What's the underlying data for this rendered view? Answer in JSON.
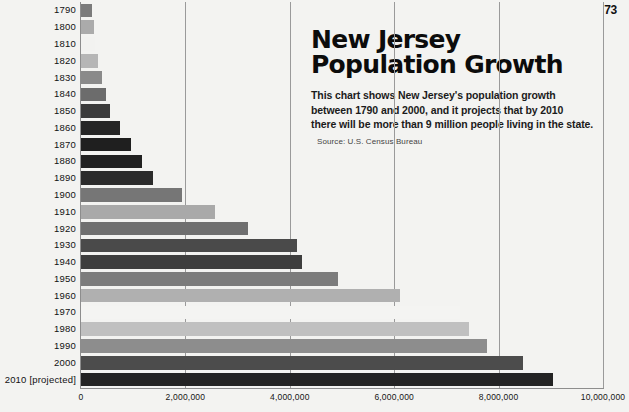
{
  "page": {
    "number": "73"
  },
  "headline": {
    "line1": "New Jersey",
    "line2": "Population Growth"
  },
  "deck": {
    "line1": "This chart shows New Jersey's population growth",
    "line2": "between 1790 and 2000, and it projects that by 2010",
    "line3": "there will be more than 9 million people living in the state.",
    "source": "Source: U.S. Census Bureau"
  },
  "chart_data": {
    "type": "bar",
    "orientation": "horizontal",
    "title": "New Jersey Population Growth",
    "xlabel": "",
    "ylabel": "",
    "xlim": [
      0,
      10000000
    ],
    "grid": true,
    "legend": false,
    "xticks": [
      "0",
      "2,000,000",
      "4,000,000",
      "6,000,000",
      "8,000,000",
      "10,000,000"
    ],
    "xtick_values": [
      0,
      2000000,
      4000000,
      6000000,
      8000000,
      10000000
    ],
    "categories": [
      "1790",
      "1800",
      "1810",
      "1820",
      "1830",
      "1840",
      "1850",
      "1860",
      "1870",
      "1880",
      "1890",
      "1900",
      "1910",
      "1920",
      "1930",
      "1940",
      "1950",
      "1960",
      "1970",
      "1980",
      "1990",
      "2000",
      "2010 [projected]"
    ],
    "values": [
      210000,
      250000,
      270000,
      330000,
      400000,
      480000,
      550000,
      740000,
      960000,
      1170000,
      1380000,
      1930000,
      2570000,
      3200000,
      4130000,
      4230000,
      4920000,
      6110000,
      7260000,
      7430000,
      7780000,
      8470000,
      9040000
    ],
    "bar_colors": [
      "#7b7b7b",
      "#ababab",
      "#f2f2f0",
      "#b6b6b6",
      "#8a8a8a",
      "#6c6c6c",
      "#3b3b3b",
      "#262626",
      "#1f1f1f",
      "#212121",
      "#2b2b2b",
      "#767676",
      "#a9a9a9",
      "#6f6f6f",
      "#4a4a4a",
      "#3e3e3e",
      "#7c7c7c",
      "#b0b0b0",
      "#f4f4f2",
      "#c0c0c0",
      "#8d8d8d",
      "#4c4c4c",
      "#232323"
    ]
  },
  "colors": {
    "background": "#f3f3f1",
    "axis": "#8d8d8d",
    "text": "#111111"
  }
}
